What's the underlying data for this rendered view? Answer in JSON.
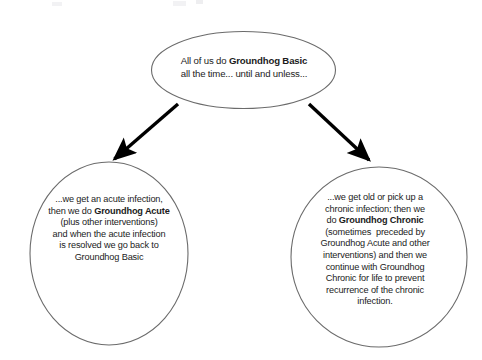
{
  "diagram": {
    "type": "flowchart",
    "background_color": "#ffffff",
    "stroke_color": "#6b6b6b",
    "arrow_color": "#000000",
    "text_color": "#1b1b1b",
    "nodes": [
      {
        "id": "basic",
        "shape": "ellipse",
        "label": "All of us do Groundhog Basic all the time... until and unless...",
        "lines": [
          {
            "segments": [
              {
                "text": "All of us do ",
                "bold": false
              },
              {
                "text": "Groundhog Basic",
                "bold": true
              }
            ]
          },
          {
            "segments": [
              {
                "text": "all the time... until and unless...",
                "bold": false
              }
            ]
          }
        ]
      },
      {
        "id": "acute",
        "shape": "ellipse",
        "label": "...we get an acute infection, then we do Groundhog Acute (plus other interventions) and when the acute infection is resolved we go back to Groundhog Basic",
        "lines": [
          {
            "segments": [
              {
                "text": "...we get an acute infection,",
                "bold": false
              }
            ]
          },
          {
            "segments": [
              {
                "text": "then we do ",
                "bold": false
              },
              {
                "text": "Groundhog Acute",
                "bold": true
              }
            ]
          },
          {
            "segments": [
              {
                "text": "(plus other interventions)",
                "bold": false
              }
            ]
          },
          {
            "segments": [
              {
                "text": "and when the acute infection",
                "bold": false
              }
            ]
          },
          {
            "segments": [
              {
                "text": "is resolved we go back to",
                "bold": false
              }
            ]
          },
          {
            "segments": [
              {
                "text": "Groundhog Basic",
                "bold": false
              }
            ]
          }
        ]
      },
      {
        "id": "chronic",
        "shape": "ellipse",
        "label": "...we get old or pick up a chronic infection; then we do Groundhog Chronic (sometimes  preceded by Groundhog Acute and other interventions) and then we continue with Groundhog Chronic for life to prevent recurrence of the chronic infection.",
        "lines": [
          {
            "segments": [
              {
                "text": "...we get old or pick up a",
                "bold": false
              }
            ]
          },
          {
            "segments": [
              {
                "text": "chronic infection; then we",
                "bold": false
              }
            ]
          },
          {
            "segments": [
              {
                "text": "do ",
                "bold": false
              },
              {
                "text": "Groundhog Chronic",
                "bold": true
              }
            ]
          },
          {
            "segments": [
              {
                "text": "(sometimes  preceded by",
                "bold": false
              }
            ]
          },
          {
            "segments": [
              {
                "text": "Groundhog Acute and other",
                "bold": false
              }
            ]
          },
          {
            "segments": [
              {
                "text": "interventions) and then we",
                "bold": false
              }
            ]
          },
          {
            "segments": [
              {
                "text": "continue with Groundhog",
                "bold": false
              }
            ]
          },
          {
            "segments": [
              {
                "text": "Chronic for life to prevent",
                "bold": false
              }
            ]
          },
          {
            "segments": [
              {
                "text": "recurrence of the chronic",
                "bold": false
              }
            ]
          },
          {
            "segments": [
              {
                "text": "infection.",
                "bold": false
              }
            ]
          }
        ]
      }
    ],
    "edges": [
      {
        "id": "edge-basic-to-acute",
        "from": "basic",
        "to": "acute",
        "label": "",
        "style": "solid-arrow"
      },
      {
        "id": "edge-basic-to-chronic",
        "from": "basic",
        "to": "chronic",
        "label": "",
        "style": "solid-arrow"
      }
    ]
  }
}
